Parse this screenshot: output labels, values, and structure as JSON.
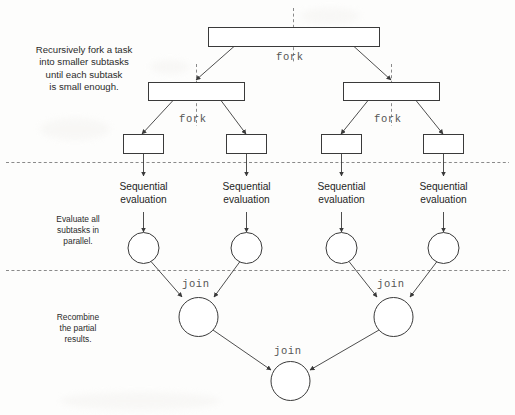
{
  "diagram": {
    "colors": {
      "stroke": "#3a3a3a",
      "dashed_guide": "#8a8a8a",
      "text": "#1f1f1f",
      "mono_text": "#555555",
      "background": "#fdfdfc"
    },
    "annotations": [
      {
        "id": "fork-note",
        "text": "Recursively fork a task\ninto smaller subtasks\nuntil each subtask\nis small enough."
      },
      {
        "id": "eval-note",
        "text": "Evaluate all\nsubtasks in\nparallel."
      },
      {
        "id": "join-note",
        "text": "Recombine\nthe partial\nresults."
      }
    ],
    "fork_labels": [
      {
        "id": "fork-root",
        "text": "fork"
      },
      {
        "id": "fork-left-level2",
        "text": "fork"
      },
      {
        "id": "fork-right-level2",
        "text": "fork"
      }
    ],
    "join_labels": [
      {
        "id": "join-left",
        "text": "join"
      },
      {
        "id": "join-right",
        "text": "join"
      },
      {
        "id": "join-bottom",
        "text": "join"
      }
    ],
    "sequential_labels": [
      {
        "id": "seq-1",
        "text": "Sequential\nevaluation"
      },
      {
        "id": "seq-2",
        "text": "Sequential\nevaluation"
      },
      {
        "id": "seq-3",
        "text": "Sequential\nevaluation"
      },
      {
        "id": "seq-4",
        "text": "Sequential\nevaluation"
      }
    ],
    "task_boxes": [
      {
        "id": "task-root",
        "level": 1,
        "label": ""
      },
      {
        "id": "task-l2-left",
        "level": 2,
        "label": ""
      },
      {
        "id": "task-l2-right",
        "level": 2,
        "label": ""
      },
      {
        "id": "task-l3-1",
        "level": 3,
        "label": ""
      },
      {
        "id": "task-l3-2",
        "level": 3,
        "label": ""
      },
      {
        "id": "task-l3-3",
        "level": 3,
        "label": ""
      },
      {
        "id": "task-l3-4",
        "level": 3,
        "label": ""
      }
    ],
    "result_nodes": [
      {
        "id": "result-1",
        "label": ""
      },
      {
        "id": "result-2",
        "label": ""
      },
      {
        "id": "result-3",
        "label": ""
      },
      {
        "id": "result-4",
        "label": ""
      },
      {
        "id": "join-node-left",
        "label": ""
      },
      {
        "id": "join-node-right",
        "label": ""
      },
      {
        "id": "join-node-bottom",
        "label": ""
      }
    ],
    "phase_dividers": 2
  }
}
